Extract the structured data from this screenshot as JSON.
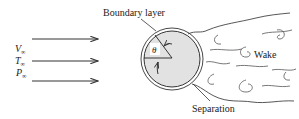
{
  "diagram": {
    "freestream": {
      "labels": {
        "velocity": "V",
        "temperature": "T",
        "pressure": "P",
        "subscript": "∞"
      },
      "arrow_count": 3
    },
    "body": {
      "shape": "circle",
      "fill": "#e2e2e2",
      "angle_label": "θ"
    },
    "labels": {
      "boundary_layer": "Boundary layer",
      "wake": "Wake",
      "separation": "Separation"
    },
    "colors": {
      "stroke": "#333333",
      "text": "#222222",
      "body_fill": "#e2e2e2"
    }
  }
}
